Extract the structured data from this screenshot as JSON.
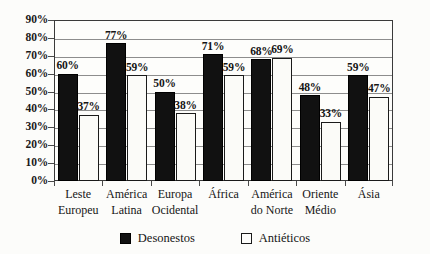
{
  "chart_data": {
    "type": "bar",
    "title": "",
    "subtitle": "",
    "xlabel": "",
    "ylabel": "",
    "ylim": [
      0,
      90
    ],
    "ytick_labels": [
      "0%",
      "10%",
      "20%",
      "30%",
      "40%",
      "50%",
      "60%",
      "70%",
      "80%",
      "90%"
    ],
    "ytick_values": [
      0,
      10,
      20,
      30,
      40,
      50,
      60,
      70,
      80,
      90
    ],
    "grid": true,
    "legend_position": "bottom",
    "value_label_suffix": "%",
    "categories": [
      "Leste Europeu",
      "América Latina",
      "Europa Ocidental",
      "África",
      "América do Norte",
      "Oriente Médio",
      "Ásia"
    ],
    "category_lines": [
      [
        "Leste",
        "Europeu"
      ],
      [
        "América",
        "Latina"
      ],
      [
        "Europa",
        "Ocidental"
      ],
      [
        "África",
        ""
      ],
      [
        "América",
        "do Norte"
      ],
      [
        "Oriente",
        "Médio"
      ],
      [
        "Ásia",
        ""
      ]
    ],
    "series": [
      {
        "name": "Desonestos",
        "color": "#111111",
        "values": [
          60,
          77,
          50,
          71,
          68,
          48,
          59
        ],
        "value_labels": [
          "60%",
          "77%",
          "50%",
          "71%",
          "68%",
          "48%",
          "59%"
        ]
      },
      {
        "name": "Antiéticos",
        "color": "#fdfdfb",
        "values": [
          37,
          59,
          38,
          59,
          69,
          33,
          47
        ],
        "value_labels": [
          "37%",
          "59%",
          "38%",
          "59%",
          "69%",
          "33%",
          "47%"
        ]
      }
    ]
  },
  "legend": {
    "entries": [
      {
        "label": "Desonestos",
        "swatch": "dark-square-icon"
      },
      {
        "label": "Antiéticos",
        "swatch": "light-square-icon"
      }
    ]
  },
  "colors": {
    "series_dark": "#111111",
    "series_light": "#fdfdfb",
    "axis": "#3a3a3a",
    "gridline": "#8d8d8d",
    "text": "#151515",
    "background": "#fcfcfa"
  }
}
